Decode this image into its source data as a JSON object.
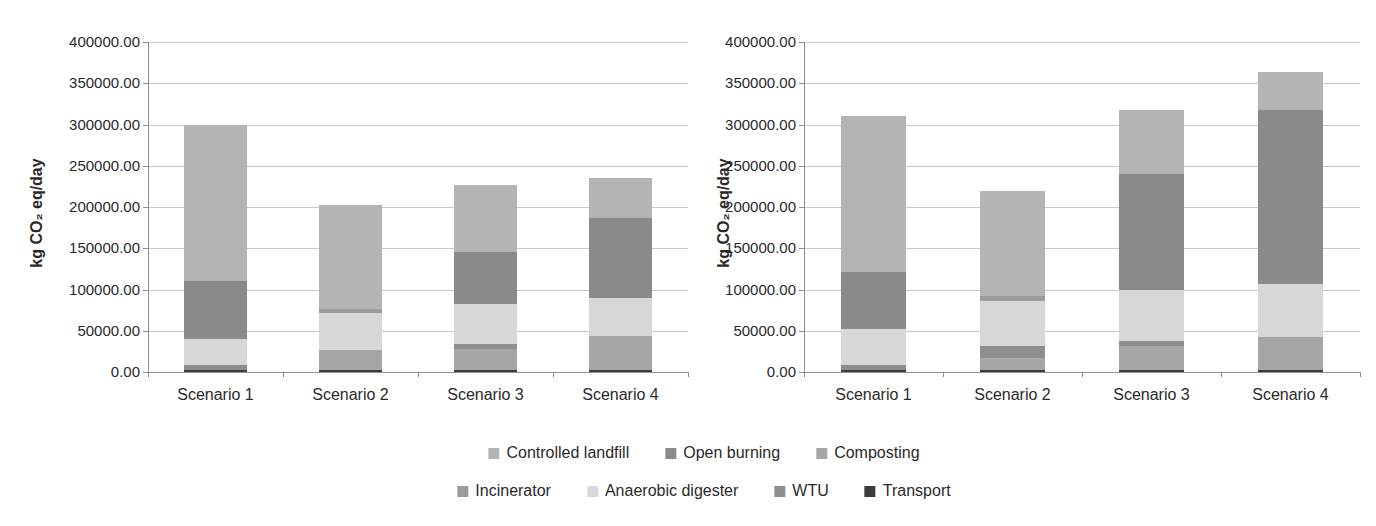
{
  "figure": {
    "background": "#ffffff"
  },
  "axis": {
    "ytick_labels": [
      "400000.00",
      "350000.00",
      "300000.00",
      "250000.00",
      "200000.00",
      "150000.00",
      "100000.00",
      "50000.00",
      "0.00"
    ]
  },
  "legend": {
    "items": [
      {
        "label": "Controlled landfill",
        "color": "#b4b4b4"
      },
      {
        "label": "Open burning",
        "color": "#8a8a8a"
      },
      {
        "label": "Composting",
        "color": "#a6a6a6"
      },
      {
        "label": "Incinerator",
        "color": "#9b9b9b"
      },
      {
        "label": "Anaerobic digester",
        "color": "#d7d7d7"
      },
      {
        "label": "WTU",
        "color": "#8e8e8e"
      },
      {
        "label": "Transport",
        "color": "#3c3c3c"
      }
    ],
    "rows": [
      [
        0,
        1,
        2
      ],
      [
        3,
        4,
        5,
        6
      ]
    ]
  },
  "chart_data": [
    {
      "type": "bar",
      "stacked": true,
      "title": "",
      "xlabel": "",
      "ylabel": "kg CO₂ eq/day",
      "ylim": [
        0,
        400000
      ],
      "ytick_step": 50000,
      "grid": true,
      "legend_position": "bottom-shared",
      "categories": [
        "Scenario 1",
        "Scenario 2",
        "Scenario 3",
        "Scenario 4"
      ],
      "stack_order": "bottom-to-top",
      "series": [
        {
          "name": "Transport",
          "color": "#3c3c3c",
          "values": [
            2000,
            2000,
            2500,
            2000
          ]
        },
        {
          "name": "Composting",
          "color": "#a6a6a6",
          "values": [
            0,
            25000,
            25500,
            42000
          ]
        },
        {
          "name": "WTU",
          "color": "#8e8e8e",
          "values": [
            6000,
            0,
            6000,
            0
          ]
        },
        {
          "name": "Anaerobic digester",
          "color": "#d7d7d7",
          "values": [
            32000,
            45000,
            48000,
            46000
          ]
        },
        {
          "name": "Incinerator",
          "color": "#9b9b9b",
          "values": [
            0,
            4000,
            0,
            0
          ]
        },
        {
          "name": "Open burning",
          "color": "#8a8a8a",
          "values": [
            70000,
            0,
            64000,
            97000
          ]
        },
        {
          "name": "Controlled landfill",
          "color": "#b4b4b4",
          "values": [
            190000,
            126000,
            81000,
            48000
          ]
        }
      ],
      "totals": [
        300000,
        202000,
        227000,
        235000
      ]
    },
    {
      "type": "bar",
      "stacked": true,
      "title": "",
      "xlabel": "",
      "ylabel": "kg CO₂ eq/day",
      "ylim": [
        0,
        400000
      ],
      "ytick_step": 50000,
      "grid": true,
      "legend_position": "bottom-shared",
      "categories": [
        "Scenario 1",
        "Scenario 2",
        "Scenario 3",
        "Scenario 4"
      ],
      "stack_order": "bottom-to-top",
      "series": [
        {
          "name": "Transport",
          "color": "#3c3c3c",
          "values": [
            2000,
            2000,
            2500,
            2500
          ]
        },
        {
          "name": "Composting",
          "color": "#a6a6a6",
          "values": [
            0,
            15000,
            29500,
            40500
          ]
        },
        {
          "name": "WTU",
          "color": "#8e8e8e",
          "values": [
            7000,
            14000,
            5000,
            0
          ]
        },
        {
          "name": "Anaerobic digester",
          "color": "#d7d7d7",
          "values": [
            43000,
            55000,
            63000,
            64000
          ]
        },
        {
          "name": "Incinerator",
          "color": "#9b9b9b",
          "values": [
            0,
            6000,
            0,
            0
          ]
        },
        {
          "name": "Open burning",
          "color": "#8a8a8a",
          "values": [
            69000,
            0,
            140000,
            210000
          ]
        },
        {
          "name": "Controlled landfill",
          "color": "#b4b4b4",
          "values": [
            189000,
            127000,
            78000,
            47000
          ]
        }
      ],
      "totals": [
        310000,
        219000,
        318000,
        364000
      ]
    }
  ]
}
